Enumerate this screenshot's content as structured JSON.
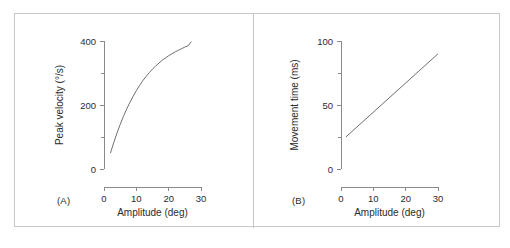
{
  "figure": {
    "background_color": "#ffffff",
    "frame_color": "#c8c8c8",
    "axis_color": "#8a8a8a",
    "curve_color": "#6e6e6e",
    "text_color": "#2b2b2b"
  },
  "panels": [
    {
      "label": "(A)",
      "name": "panel-a"
    },
    {
      "label": "(B)",
      "name": "panel-b"
    }
  ],
  "chart_data": [
    {
      "type": "line",
      "panel": "(A)",
      "title": "",
      "xlabel": "Amplitude (deg)",
      "ylabel": "Peak velocity (°/s)",
      "xlim": [
        0,
        30
      ],
      "ylim": [
        0,
        400
      ],
      "xticks": [
        0,
        10,
        20,
        30
      ],
      "xtick_labels": [
        "0",
        "10",
        "20",
        "30"
      ],
      "yticks": [
        0,
        200,
        400
      ],
      "ytick_labels": [
        "0",
        "200",
        "400"
      ],
      "yminor_ticks": [
        100,
        300
      ],
      "grid": false,
      "legend": null,
      "series": [
        {
          "name": "peak velocity",
          "x": [
            2,
            3,
            4,
            5,
            6,
            7,
            8,
            9,
            10,
            11,
            12,
            13,
            14,
            15,
            16,
            17,
            18,
            19,
            20,
            21,
            22,
            23,
            24,
            25,
            26,
            27
          ],
          "y": [
            50,
            82,
            112,
            139,
            164,
            187,
            208,
            227,
            245,
            261,
            276,
            289,
            301,
            312,
            322,
            331,
            340,
            347,
            354,
            360,
            366,
            371,
            376,
            381,
            385,
            398
          ]
        }
      ]
    },
    {
      "type": "line",
      "panel": "(B)",
      "title": "",
      "xlabel": "Amplitude (deg)",
      "ylabel": "Movement time (ms)",
      "xlim": [
        0,
        30
      ],
      "ylim": [
        0,
        100
      ],
      "xticks": [
        0,
        10,
        20,
        30
      ],
      "xtick_labels": [
        "0",
        "10",
        "20",
        "30"
      ],
      "yticks": [
        0,
        50,
        100
      ],
      "ytick_labels": [
        "0",
        "50",
        "100"
      ],
      "yminor_ticks": [
        25,
        75
      ],
      "grid": false,
      "legend": null,
      "series": [
        {
          "name": "movement time",
          "x": [
            1.5,
            30
          ],
          "y": [
            25,
            90
          ]
        }
      ]
    }
  ]
}
